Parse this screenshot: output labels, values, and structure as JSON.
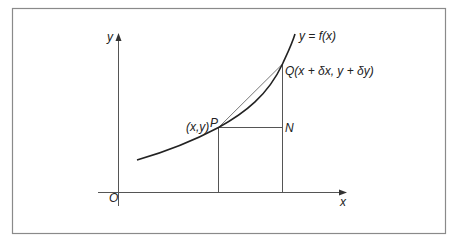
{
  "figure": {
    "frame": {
      "x": 12,
      "y": 8,
      "width": 433,
      "height": 225,
      "color": "#8a8a8a"
    },
    "axes": {
      "origin_label": "O",
      "x_label": "x",
      "y_label": "y",
      "color": "#555555"
    },
    "curve": {
      "label": "y = f(x)",
      "color": "#222222"
    },
    "points": {
      "P": {
        "name": "P",
        "coord_label": "(x,y)"
      },
      "Q": {
        "name": "Q",
        "coord_label": "(x + δx, y + δy)",
        "full_label": "Q(x + δx, y + δy)"
      },
      "N": {
        "name": "N"
      }
    },
    "chord": {
      "from": "P",
      "to": "Q",
      "color": "#666666"
    }
  }
}
